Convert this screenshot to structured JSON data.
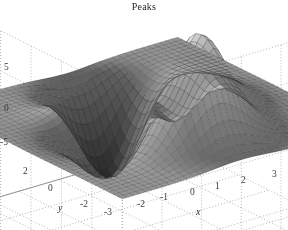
{
  "figure": {
    "title": "Peaks",
    "background_color": "#ffffff",
    "text_color": "#2b2b2b",
    "width": 288,
    "height": 230
  },
  "chart_data": {
    "type": "surface",
    "title": "Peaks",
    "xlabel": "x",
    "ylabel": "y",
    "zlabel": "",
    "colormap": "gray",
    "shading": "faceted",
    "grid": true,
    "legend": null,
    "xlim": [
      -3,
      3
    ],
    "ylim": [
      -3,
      3
    ],
    "zlim": [
      -8,
      8
    ],
    "xticks": [
      -3,
      -2,
      -1,
      0,
      1,
      2,
      3
    ],
    "xtick_labels": [
      "-3",
      "-2",
      "-1",
      "0",
      "1",
      "2",
      "3"
    ],
    "yticks": [
      -3,
      -2,
      0,
      2
    ],
    "ytick_labels": [
      "-3",
      "-2",
      "0",
      "2"
    ],
    "zticks": [
      -5,
      0,
      5
    ],
    "ztick_labels": [
      "-5",
      "0",
      "5"
    ],
    "function": "peaks",
    "formula": "z = 3*(1-x)^2*exp(-x^2-(y+1)^2) - 10*(x/5 - x^3 - y^5)*exp(-x^2-y^2) - (1/3)*exp(-(x+1)^2 - y^2)",
    "grid_n": 41,
    "view": {
      "azimuth": -37.5,
      "elevation": 30
    },
    "features": [
      {
        "name": "global-maximum",
        "x": -0.01,
        "y": 1.58,
        "z": 8.11
      },
      {
        "name": "local-maximum",
        "x": 1.29,
        "y": -0.01,
        "z": 3.59
      },
      {
        "name": "global-minimum",
        "x": 0.23,
        "y": -1.63,
        "z": -6.55
      },
      {
        "name": "local-minimum",
        "x": -1.35,
        "y": 0.2,
        "z": -3.05
      }
    ]
  },
  "axes": {
    "z_ticks": [
      {
        "label": "5",
        "left": 4,
        "top": 63
      },
      {
        "label": "0",
        "left": 4,
        "top": 104
      },
      {
        "label": "-5",
        "left": 0,
        "top": 138
      }
    ],
    "y_ticks": [
      {
        "label": "2",
        "left": 23,
        "top": 167
      },
      {
        "label": "0",
        "left": 48,
        "top": 184
      },
      {
        "label": "-2",
        "left": 80,
        "top": 200
      },
      {
        "label": "-3",
        "left": 104,
        "top": 208
      }
    ],
    "x_ticks": [
      {
        "label": "-2",
        "left": 137,
        "top": 200
      },
      {
        "label": "-1",
        "left": 160,
        "top": 193
      },
      {
        "label": "0",
        "left": 190,
        "top": 188
      },
      {
        "label": "1",
        "left": 215,
        "top": 182
      },
      {
        "label": "2",
        "left": 241,
        "top": 176
      },
      {
        "label": "3",
        "left": 272,
        "top": 170
      }
    ],
    "x_axis_label": {
      "text": "x",
      "left": 196,
      "top": 207
    },
    "y_axis_label": {
      "text": "y",
      "left": 58,
      "top": 203
    }
  },
  "style": {
    "grid_line_color": "#9a9a9a",
    "axis_line_color": "#7d7d7d",
    "mesh_line_color": "#2c2c2c",
    "surface_light": "#f2f2f2",
    "surface_dark": "#111111",
    "plane_tone": "#4a4a4a"
  }
}
